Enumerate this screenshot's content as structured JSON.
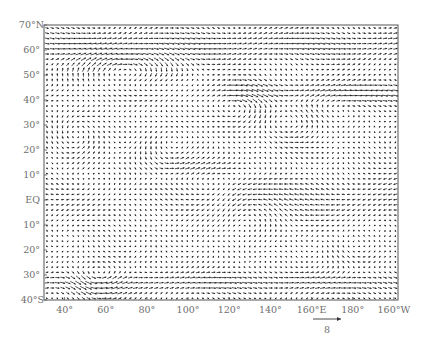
{
  "chart_data": {
    "type": "vector-field",
    "title": "",
    "xlabel": "",
    "ylabel": "",
    "x_ticks": [
      "40°",
      "60°",
      "80°",
      "100°",
      "120°",
      "140°",
      "160°E",
      "180°",
      "160°W"
    ],
    "x_tick_lon": [
      40,
      60,
      80,
      100,
      120,
      140,
      160,
      180,
      200
    ],
    "y_ticks": [
      "70°N",
      "60°",
      "50°",
      "40°",
      "30°",
      "20°",
      "10°",
      "EQ",
      "10°",
      "20°",
      "30°",
      "40°S"
    ],
    "y_tick_lat": [
      70,
      60,
      50,
      40,
      30,
      20,
      10,
      0,
      -10,
      -20,
      -30,
      -40
    ],
    "xlim": [
      30,
      202
    ],
    "ylim": [
      -40,
      70
    ],
    "reference_vector": {
      "label": "8",
      "length_px": 28
    },
    "grid": false,
    "features": [
      {
        "name": "anticyclonic gyre",
        "lon": [
          45,
          100
        ],
        "lat": [
          45,
          57
        ]
      },
      {
        "name": "westerly jet",
        "lon": [
          130,
          200
        ],
        "lat": [
          40,
          50
        ]
      },
      {
        "name": "easterly band",
        "lon": [
          130,
          200
        ],
        "lat": [
          -10,
          10
        ]
      },
      {
        "name": "cyclonic vortex",
        "lon": [
          40,
          75
        ],
        "lat": [
          -38,
          -25
        ]
      },
      {
        "name": "convergent jet",
        "lon": [
          160,
          200
        ],
        "lat": [
          -35,
          -25
        ]
      }
    ]
  },
  "axes": {
    "frame": {
      "left": 44,
      "top": 25,
      "right": 398,
      "bottom": 300
    }
  },
  "colors": {
    "arrow": "#1a1a1a",
    "frame": "#555555",
    "label": "#6e6e6e"
  }
}
